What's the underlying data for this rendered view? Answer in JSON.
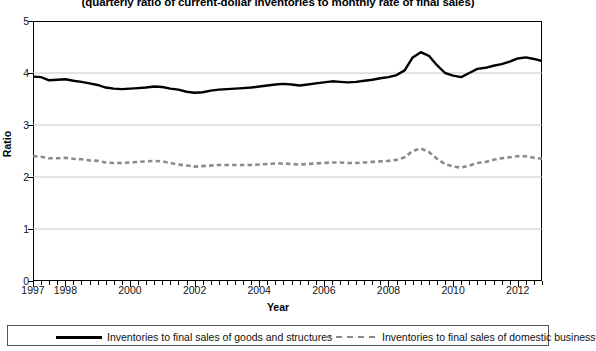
{
  "chart_data": {
    "type": "line",
    "title": "(quarterly ratio of current-dollar inventories to monthly rate of final sales)",
    "xlabel": "Year",
    "ylabel": "Ratio",
    "ylim": [
      0,
      5
    ],
    "y_ticks": [
      0,
      1,
      2,
      3,
      4,
      5
    ],
    "xlim": [
      1997.0,
      2012.75
    ],
    "x_tick_labels": [
      "1997",
      "1998",
      "2000",
      "2002",
      "2004",
      "2006",
      "2008",
      "2010",
      "2012"
    ],
    "x_tick_values": [
      1997,
      1998,
      2000,
      2002,
      2004,
      2006,
      2008,
      2010,
      2012
    ],
    "minor_tick_interval_quarters": 1,
    "grid": "horizontal",
    "legend_position": "bottom",
    "x": [
      1997.0,
      1997.25,
      1997.5,
      1997.75,
      1998.0,
      1998.25,
      1998.5,
      1998.75,
      1999.0,
      1999.25,
      1999.5,
      1999.75,
      2000.0,
      2000.25,
      2000.5,
      2000.75,
      2001.0,
      2001.25,
      2001.5,
      2001.75,
      2002.0,
      2002.25,
      2002.5,
      2002.75,
      2003.0,
      2003.25,
      2003.5,
      2003.75,
      2004.0,
      2004.25,
      2004.5,
      2004.75,
      2005.0,
      2005.25,
      2005.5,
      2005.75,
      2006.0,
      2006.25,
      2006.5,
      2006.75,
      2007.0,
      2007.25,
      2007.5,
      2007.75,
      2008.0,
      2008.25,
      2008.5,
      2008.75,
      2009.0,
      2009.25,
      2009.5,
      2009.75,
      2010.0,
      2010.25,
      2010.5,
      2010.75,
      2011.0,
      2011.25,
      2011.5,
      2011.75,
      2012.0,
      2012.25,
      2012.5,
      2012.75
    ],
    "series": [
      {
        "name": "Inventories to final sales of goods and structures",
        "style": "solid",
        "color": "#000000",
        "values": [
          3.93,
          3.92,
          3.86,
          3.87,
          3.88,
          3.85,
          3.83,
          3.8,
          3.77,
          3.72,
          3.7,
          3.69,
          3.7,
          3.71,
          3.72,
          3.74,
          3.73,
          3.7,
          3.68,
          3.64,
          3.62,
          3.63,
          3.66,
          3.68,
          3.69,
          3.7,
          3.71,
          3.72,
          3.74,
          3.76,
          3.78,
          3.79,
          3.78,
          3.76,
          3.78,
          3.8,
          3.82,
          3.84,
          3.83,
          3.82,
          3.83,
          3.85,
          3.87,
          3.9,
          3.92,
          3.96,
          4.05,
          4.3,
          4.4,
          4.33,
          4.15,
          4.0,
          3.95,
          3.92,
          4.0,
          4.08,
          4.1,
          4.14,
          4.17,
          4.22,
          4.28,
          4.3,
          4.27,
          4.23
        ]
      },
      {
        "name": "Inventories to final sales of domestic business",
        "style": "dashed",
        "color": "#8a8a8a",
        "values": [
          2.4,
          2.39,
          2.36,
          2.36,
          2.37,
          2.35,
          2.34,
          2.32,
          2.31,
          2.28,
          2.27,
          2.27,
          2.28,
          2.29,
          2.3,
          2.31,
          2.3,
          2.27,
          2.24,
          2.22,
          2.2,
          2.21,
          2.22,
          2.23,
          2.23,
          2.23,
          2.23,
          2.23,
          2.24,
          2.25,
          2.26,
          2.26,
          2.25,
          2.24,
          2.25,
          2.26,
          2.27,
          2.28,
          2.28,
          2.27,
          2.27,
          2.28,
          2.29,
          2.3,
          2.31,
          2.33,
          2.38,
          2.5,
          2.55,
          2.48,
          2.35,
          2.25,
          2.2,
          2.18,
          2.22,
          2.27,
          2.29,
          2.33,
          2.36,
          2.38,
          2.4,
          2.4,
          2.37,
          2.35
        ]
      }
    ]
  },
  "legend": {
    "entries": [
      {
        "label": "Inventories to final sales of goods and structures",
        "style": "solid"
      },
      {
        "label": "Inventories to final sales of domestic business",
        "style": "dashed"
      }
    ]
  },
  "axes": {
    "y_title": "Ratio",
    "x_title": "Year"
  }
}
